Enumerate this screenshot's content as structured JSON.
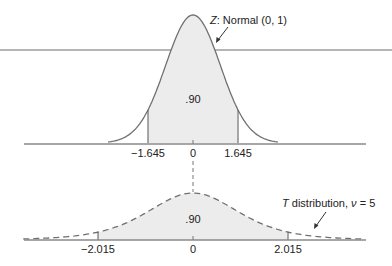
{
  "chart_data": [
    {
      "type": "area",
      "title": "",
      "annotation": "Z: Normal (0, 1)",
      "annotation_italic": "Z",
      "annotation_rest": ": Normal (0, 1)",
      "distribution": "normal",
      "mean": 0,
      "sd": 1,
      "shaded_interval": [
        -1.645,
        1.645
      ],
      "shaded_area_label": ".90",
      "tick_labels": [
        "−1.645",
        "0",
        "1.645"
      ],
      "tick_values": [
        -1.645,
        0,
        1.645
      ],
      "line_style": "solid",
      "grid": false
    },
    {
      "type": "area",
      "title": "",
      "annotation": "T distribution, ν = 5",
      "annotation_italic": "T",
      "annotation_rest": " distribution, ",
      "annotation_nu": "ν",
      "annotation_tail": " = 5",
      "distribution": "t",
      "df": 5,
      "shaded_interval": [
        -2.015,
        2.015
      ],
      "shaded_area_label": ".90",
      "tick_labels": [
        "−2.015",
        "0",
        "2.015"
      ],
      "tick_values": [
        -2.015,
        0,
        2.015
      ],
      "line_style": "dashed",
      "grid": false
    }
  ],
  "colors": {
    "curve": "#707070",
    "fill": "#ececec",
    "axis": "#8a8a8a",
    "overlay_line": "#b5b5b5",
    "text": "#222222"
  }
}
